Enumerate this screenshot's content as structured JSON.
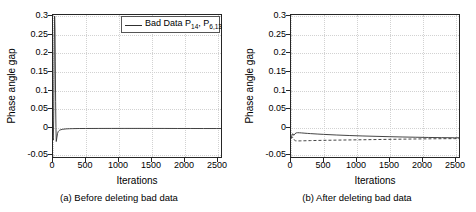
{
  "figure": {
    "panels": [
      {
        "id": "panel-a",
        "caption": "(a) Before deleting bad data",
        "xlabel": "Iterations",
        "ylabel": "Phase angle gap",
        "legend": [
          {
            "label_prefix": "Bad Data  P",
            "sub1": "14",
            "sep": ", P",
            "sub2": "6,13",
            "style": "solid"
          }
        ]
      },
      {
        "id": "panel-b",
        "caption": "(b) After deleting bad data",
        "xlabel": "Iterations",
        "ylabel": "Phase angle gap",
        "legend": [
          {
            "label_prefix": "Delete P",
            "sub1": "14",
            "sep": "",
            "sub2": "",
            "style": "dashed"
          },
          {
            "label_prefix": "Delete P",
            "sub1": "14",
            "sep": ", P",
            "sub2": "6,13",
            "style": "solid"
          }
        ]
      }
    ],
    "yticks": [
      "0.3",
      "0.25",
      "0.2",
      "0.15",
      "0.1",
      "0.05",
      "0",
      "-0.05"
    ],
    "ytick_values": [
      0.3,
      0.25,
      0.2,
      0.15,
      0.1,
      0.05,
      0,
      -0.05
    ],
    "xticks": [
      "0",
      "500",
      "1000",
      "1500",
      "2000",
      "2500"
    ],
    "xtick_values": [
      0,
      500,
      1000,
      1500,
      2000,
      2500
    ],
    "colors": {
      "line": "#303030",
      "axis": "#262626",
      "grid": "#d2d2d2",
      "background": "#ffffff"
    }
  },
  "chart_data": [
    {
      "type": "line",
      "title": "(a) Before deleting bad data",
      "xlabel": "Iterations",
      "ylabel": "Phase angle gap",
      "xlim": [
        0,
        2570
      ],
      "ylim": [
        -0.05,
        0.335
      ],
      "grid": true,
      "legend_position": "top-right",
      "series": [
        {
          "name": "Bad Data  P14, P6,13",
          "style": "solid",
          "x": [
            0,
            5,
            10,
            15,
            20,
            25,
            30,
            35,
            40,
            45,
            50,
            60,
            70,
            80,
            90,
            100,
            120,
            150,
            200,
            250,
            300,
            400,
            500,
            700,
            900,
            1100,
            1300,
            1500,
            1700,
            1900,
            2100,
            2300,
            2500,
            2570
          ],
          "y": [
            0.0,
            -0.004,
            0.05,
            0.16,
            0.27,
            0.332,
            0.3,
            0.21,
            0.1,
            0.03,
            -0.008,
            0.004,
            0.014,
            0.019,
            0.021,
            0.0225,
            0.024,
            0.0252,
            0.0262,
            0.0266,
            0.0269,
            0.0272,
            0.0273,
            0.0274,
            0.02745,
            0.0275,
            0.0275,
            0.0274,
            0.0274,
            0.0273,
            0.0273,
            0.0272,
            0.0272,
            0.0272
          ]
        }
      ]
    },
    {
      "type": "line",
      "title": "(b) After deleting bad data",
      "xlabel": "Iterations",
      "ylabel": "Phase angle gap",
      "xlim": [
        0,
        2570
      ],
      "ylim": [
        -0.05,
        0.335
      ],
      "grid": true,
      "legend_position": "top-right",
      "series": [
        {
          "name": "Delete P14",
          "style": "dashed",
          "x": [
            0,
            10,
            20,
            30,
            40,
            50,
            70,
            100,
            150,
            200,
            300,
            500,
            800,
            1100,
            1400,
            1700,
            2000,
            2300,
            2500,
            2570
          ],
          "y": [
            0.0,
            0.002,
            0.004,
            0.003,
            0.0,
            -0.004,
            -0.006,
            -0.0065,
            -0.0062,
            -0.006,
            -0.0055,
            -0.0048,
            -0.004,
            -0.0032,
            -0.0024,
            -0.0016,
            -0.0009,
            -0.0004,
            -0.0002,
            -0.0002
          ]
        },
        {
          "name": "Delete P14, P6,13",
          "style": "solid",
          "x": [
            0,
            10,
            20,
            30,
            40,
            50,
            60,
            80,
            100,
            130,
            160,
            200,
            250,
            300,
            400,
            500,
            700,
            900,
            1100,
            1300,
            1500,
            1700,
            1900,
            2100,
            2300,
            2500,
            2570
          ],
          "y": [
            0.0,
            0.006,
            0.012,
            0.013,
            0.009,
            0.01,
            0.013,
            0.0153,
            0.0158,
            0.0157,
            0.0153,
            0.0147,
            0.014,
            0.0134,
            0.0123,
            0.0113,
            0.0096,
            0.0082,
            0.007,
            0.006,
            0.0051,
            0.0043,
            0.0036,
            0.003,
            0.0025,
            0.0022,
            0.0021
          ]
        }
      ]
    }
  ]
}
